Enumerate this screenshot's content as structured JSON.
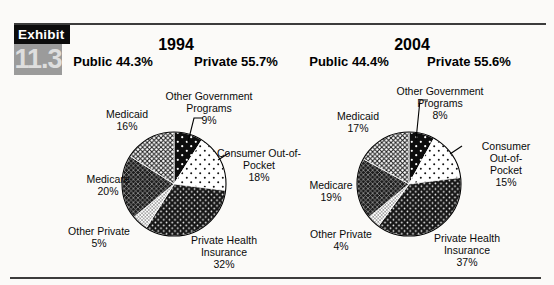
{
  "exhibit": {
    "label": "Exhibit",
    "number": "11.3"
  },
  "chart_data": [
    {
      "type": "pie",
      "title": "1994",
      "public_share": "Public  44.3%",
      "private_share": "Private 55.7%",
      "direction": "clockwise",
      "start": "12-oclock",
      "segments": [
        {
          "label": "Other Government Programs",
          "value": 9,
          "display": "Other Government\nPrograms\n9%",
          "pattern": "ogp"
        },
        {
          "label": "Consumer Out-of-Pocket",
          "value": 18,
          "display": "Consumer Out-of-\nPocket\n18%",
          "pattern": "cop"
        },
        {
          "label": "Private Health Insurance",
          "value": 32,
          "display": "Private Health\nInsurance\n32%",
          "pattern": "phi"
        },
        {
          "label": "Other Private",
          "value": 5,
          "display": "Other Private\n5%",
          "pattern": "op"
        },
        {
          "label": "Medicare",
          "value": 20,
          "display": "Medicare\n20%",
          "pattern": "medicare"
        },
        {
          "label": "Medicaid",
          "value": 16,
          "display": "Medicaid\n16%",
          "pattern": "medicaid"
        }
      ]
    },
    {
      "type": "pie",
      "title": "2004",
      "public_share": "Public 44.4%",
      "private_share": "Private 55.6%",
      "direction": "clockwise",
      "start": "12-oclock",
      "segments": [
        {
          "label": "Other Government Programs",
          "value": 8,
          "display": "Other Government\nPrograms\n8%",
          "pattern": "ogp"
        },
        {
          "label": "Consumer Out-of-Pocket",
          "value": 15,
          "display": "Consumer Out-of-\nPocket\n15%",
          "pattern": "cop"
        },
        {
          "label": "Private Health Insurance",
          "value": 37,
          "display": "Private Health\nInsurance\n37%",
          "pattern": "phi"
        },
        {
          "label": "Other Private",
          "value": 4,
          "display": "Other Private\n4%",
          "pattern": "op"
        },
        {
          "label": "Medicare",
          "value": 19,
          "display": "Medicare\n19%",
          "pattern": "medicare"
        },
        {
          "label": "Medicaid",
          "value": 17,
          "display": "Medicaid\n17%",
          "pattern": "medicaid"
        }
      ]
    }
  ],
  "colors": {
    "ink": "#000000",
    "exhibit_box": "#0c0c0c",
    "exhibit_tab": "#9b9b9b",
    "paper": "#fbfaf8"
  }
}
